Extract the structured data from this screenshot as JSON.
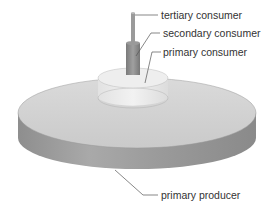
{
  "diagram": {
    "labels": {
      "tertiary": "tertiary consumer",
      "secondary": "secondary consumer",
      "primary_consumer": "primary consumer",
      "producer": "primary producer"
    },
    "colors": {
      "producer_top": "#d4d4d4",
      "producer_side": "#9a9a9a",
      "primary_consumer_top": "#ececec",
      "primary_consumer_side": "#dcdcdc",
      "secondary": "#8a8a8a",
      "tertiary": "#a8a8a8",
      "leader": "#555555",
      "text": "#333333"
    }
  }
}
